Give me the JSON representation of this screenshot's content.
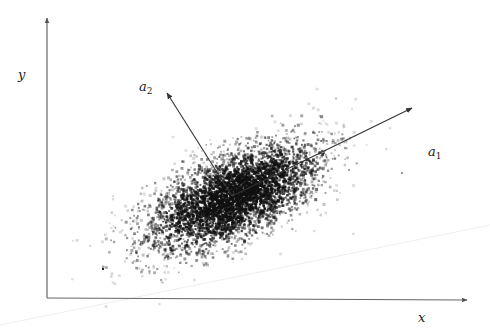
{
  "diagram": {
    "title": "",
    "axes": {
      "x_label": "x",
      "y_label": "y"
    },
    "principal_axes": [
      {
        "name": "a",
        "subscript": "1",
        "direction": "major axis, up-right"
      },
      {
        "name": "a",
        "subscript": "2",
        "direction": "minor axis, up-left"
      }
    ],
    "colors": {
      "background": "#ffffff",
      "axis": "#555555",
      "points": "#111111",
      "arrow": "#333333"
    }
  }
}
